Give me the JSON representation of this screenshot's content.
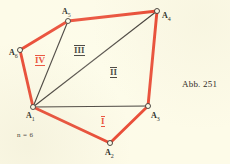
{
  "figure": {
    "caption": "Abb. 251",
    "parameter_note": "n = 6",
    "background_color": "#fdfbe8",
    "polygon_color": "#e8402a",
    "diagonal_color": "#332e2a",
    "vertices": [
      {
        "name": "A1",
        "label": "A",
        "subscript": "1",
        "x": 33,
        "y": 107,
        "label_x": 26,
        "label_y": 112
      },
      {
        "name": "A2",
        "label": "A",
        "subscript": "2",
        "x": 110,
        "y": 143,
        "label_x": 105,
        "label_y": 149
      },
      {
        "name": "A3",
        "label": "A",
        "subscript": "3",
        "x": 148,
        "y": 106,
        "label_x": 151,
        "label_y": 112
      },
      {
        "name": "A4",
        "label": "A",
        "subscript": "4",
        "x": 157,
        "y": 11,
        "label_x": 162,
        "label_y": 12
      },
      {
        "name": "A5",
        "label": "A",
        "subscript": "5",
        "x": 68,
        "y": 21,
        "label_x": 62,
        "label_y": 8
      },
      {
        "name": "A6",
        "label": "A",
        "subscript": "6",
        "x": 20,
        "y": 50,
        "label_x": 9,
        "label_y": 49
      }
    ],
    "polygon_path": "33,107 110,143 148,106 157,11 68,21 20,50",
    "diagonals": [
      {
        "name": "diagonal-a1-a3",
        "from": "A1",
        "to": "A3"
      },
      {
        "name": "diagonal-a1-a4",
        "from": "A1",
        "to": "A4"
      },
      {
        "name": "diagonal-a1-a5",
        "from": "A1",
        "to": "A5"
      }
    ],
    "regions": [
      {
        "name": "region-i",
        "label": "I",
        "x": 101,
        "y": 116,
        "color": "red"
      },
      {
        "name": "region-ii",
        "label": "II",
        "x": 110,
        "y": 67,
        "color": "black"
      },
      {
        "name": "region-iii",
        "label": "III",
        "x": 74,
        "y": 45,
        "color": "black"
      },
      {
        "name": "region-iv",
        "label": "IV",
        "x": 35,
        "y": 55,
        "color": "red"
      }
    ]
  }
}
